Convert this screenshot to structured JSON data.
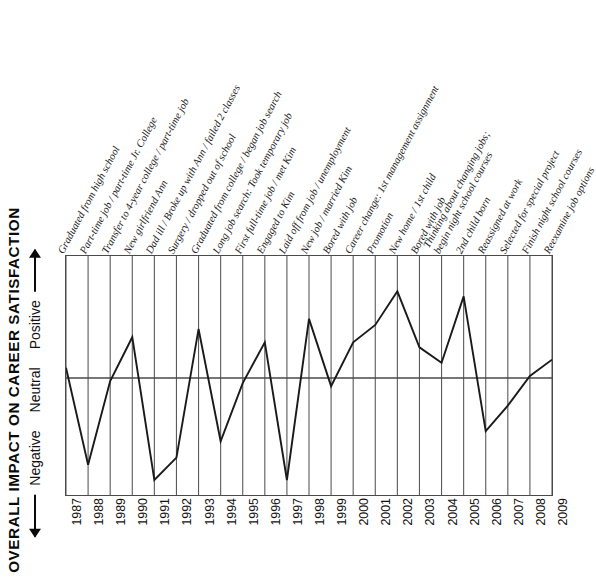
{
  "axis": {
    "title": "OVERALL IMPACT ON CAREER SATISFACTION",
    "scale_negative": "Negative",
    "scale_neutral": "Neutral",
    "scale_positive": "Positive",
    "down_arrow_icon": "down-arrow-icon",
    "up_arrow_icon": "up-arrow-icon"
  },
  "chart_data": {
    "type": "line",
    "title": "OVERALL IMPACT ON CAREER SATISFACTION",
    "xlabel": "",
    "ylabel": "OVERALL IMPACT ON CAREER SATISFACTION",
    "ylim": [
      -1.0,
      1.0
    ],
    "ytick_labels": [
      "Negative",
      "Neutral",
      "Positive"
    ],
    "grid": true,
    "legend": "none",
    "categories": [
      "1987",
      "1988",
      "1989",
      "1990",
      "1991",
      "1992",
      "1993",
      "1994",
      "1995",
      "1996",
      "1997",
      "1998",
      "1999",
      "2000",
      "2001",
      "2002",
      "2003",
      "2004",
      "2005",
      "2006",
      "2007",
      "2008",
      "2009"
    ],
    "values": [
      0.1,
      -0.85,
      -0.03,
      0.4,
      -1.0,
      -0.78,
      0.48,
      -0.62,
      -0.05,
      0.35,
      -1.0,
      0.58,
      -0.08,
      0.35,
      0.52,
      0.85,
      0.3,
      0.15,
      0.8,
      -0.52,
      -0.27,
      0.02,
      0.18
    ],
    "annotations": [
      "Graduated from high school",
      "Part-time job / part-time Jr. College",
      "Transfer to 4-year college / part-time job",
      "New girlfriend Ann",
      "Dad ill / Broke up with Ann / failed 2 classes",
      "Surgery / dropped out of school",
      "Graduated from college / began job search",
      "Long job search: Took temporary job",
      "First full-time job / met Kim",
      "Engaged to Kim",
      "Laid off from job / unemployment",
      "New job / married Kim",
      "Bored with job",
      "Career change: 1st management assignment",
      "Promotion",
      "New home / 1st child",
      "Bored with job",
      "Thinking about changing jobs; begin night school courses",
      "2nd child born",
      "Reassigned at work",
      "Selected for special project",
      "Finish night school courses",
      "Reexamine job options"
    ]
  },
  "events": [
    {
      "line1": "Graduated from high school",
      "line2": ""
    },
    {
      "line1": "Part-time job / part-time Jr. College",
      "line2": ""
    },
    {
      "line1": "Transfer to 4-year college / part-time job",
      "line2": ""
    },
    {
      "line1": "New girlfriend Ann",
      "line2": ""
    },
    {
      "line1": "Dad ill / Broke up with Ann / failed 2 classes",
      "line2": ""
    },
    {
      "line1": "Surgery / dropped out of school",
      "line2": ""
    },
    {
      "line1": "Graduated from college / began job search",
      "line2": ""
    },
    {
      "line1": "Long job search: Took temporary job",
      "line2": ""
    },
    {
      "line1": "First full-time job / met Kim",
      "line2": ""
    },
    {
      "line1": "Engaged to Kim",
      "line2": ""
    },
    {
      "line1": "Laid off from job / unemployment",
      "line2": ""
    },
    {
      "line1": "New job / married Kim",
      "line2": ""
    },
    {
      "line1": "Bored with job",
      "line2": ""
    },
    {
      "line1": "Career change: 1st management assignment",
      "line2": ""
    },
    {
      "line1": "Promotion",
      "line2": ""
    },
    {
      "line1": "New home / 1st child",
      "line2": ""
    },
    {
      "line1": "Bored with job",
      "line2": ""
    },
    {
      "line1": "Thinking about changing jobs;",
      "line2": "begin night school courses"
    },
    {
      "line1": "2nd child born",
      "line2": ""
    },
    {
      "line1": "Reassigned at work",
      "line2": ""
    },
    {
      "line1": "Selected for special project",
      "line2": ""
    },
    {
      "line1": "Finish night school courses",
      "line2": ""
    },
    {
      "line1": "Reexamine job options",
      "line2": ""
    }
  ],
  "colors": {
    "line": "#1a1a1a",
    "grid": "#5a5a5a",
    "axis": "#4a4a4a",
    "background": "#ffffff"
  }
}
